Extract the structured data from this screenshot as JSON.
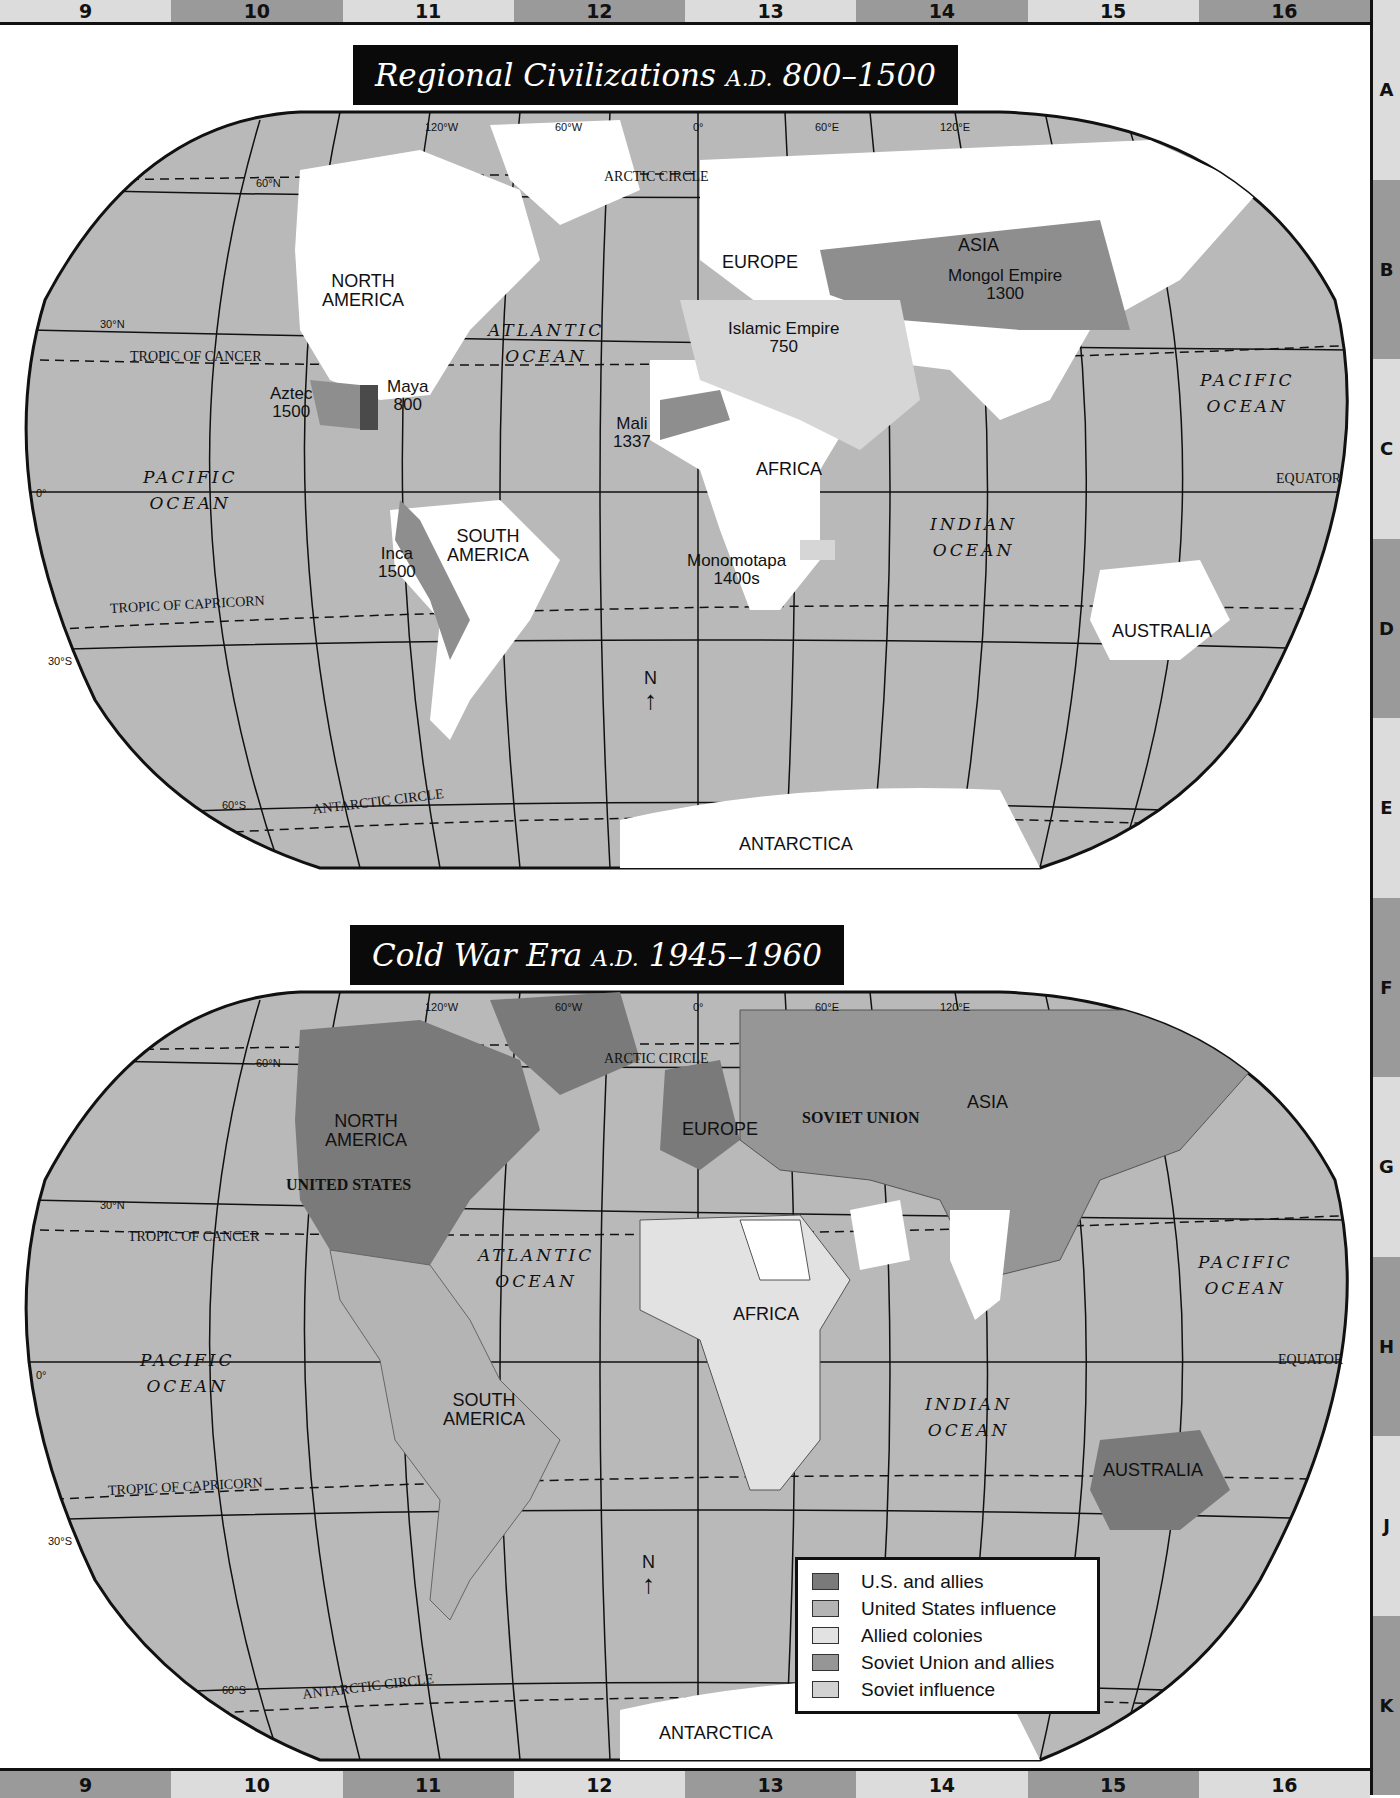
{
  "grid": {
    "columns": [
      "9",
      "10",
      "11",
      "12",
      "13",
      "14",
      "15",
      "16"
    ],
    "rows": [
      "A",
      "B",
      "C",
      "D",
      "E",
      "F",
      "G",
      "H",
      "J",
      "K"
    ]
  },
  "map1": {
    "title_main": "Regional Civilizations",
    "title_era": "A.D.",
    "title_years": "800–1500",
    "longitudes": [
      "120°W",
      "60°W",
      "0°",
      "60°E",
      "120°E"
    ],
    "latitudes": [
      "60°N",
      "30°N",
      "0°",
      "30°S",
      "60°S"
    ],
    "lines": {
      "arctic": "ARCTIC CIRCLE",
      "cancer": "TROPIC OF CANCER",
      "capricorn": "TROPIC OF CAPRICORN",
      "equator": "EQUATOR",
      "antarctic": "ANTARCTIC CIRCLE"
    },
    "continents": {
      "north_america_1": "NORTH",
      "north_america_2": "AMERICA",
      "south_america_1": "SOUTH",
      "south_america_2": "AMERICA",
      "europe": "EUROPE",
      "asia": "ASIA",
      "africa": "AFRICA",
      "australia": "AUSTRALIA",
      "antarctica": "ANTARCTICA"
    },
    "oceans": {
      "atlantic_1": "ATLANTIC",
      "atlantic_2": "OCEAN",
      "pacific_1": "PACIFIC",
      "pacific_2": "OCEAN",
      "indian_1": "INDIAN",
      "indian_2": "OCEAN"
    },
    "civilizations": [
      {
        "name": "Aztec",
        "year": "1500"
      },
      {
        "name": "Maya",
        "year": "800"
      },
      {
        "name": "Inca",
        "year": "1500"
      },
      {
        "name": "Mali",
        "year": "1337"
      },
      {
        "name": "Islamic Empire",
        "year": "750"
      },
      {
        "name": "Mongol Empire",
        "year": "1300"
      },
      {
        "name": "Monomotapa",
        "year": "1400s"
      }
    ],
    "compass": "N"
  },
  "map2": {
    "title_main": "Cold War Era",
    "title_era": "A.D.",
    "title_years": "1945–1960",
    "longitudes": [
      "120°W",
      "60°W",
      "0°",
      "60°E",
      "120°E"
    ],
    "latitudes": [
      "60°N",
      "30°N",
      "0°",
      "30°S",
      "60°S"
    ],
    "lines": {
      "arctic": "ARCTIC CIRCLE",
      "cancer": "TROPIC OF CANCER",
      "capricorn": "TROPIC OF CAPRICORN",
      "equator": "EQUATOR",
      "antarctic": "ANTARCTIC CIRCLE"
    },
    "continents": {
      "north_america_1": "NORTH",
      "north_america_2": "AMERICA",
      "united_states": "UNITED STATES",
      "south_america_1": "SOUTH",
      "south_america_2": "AMERICA",
      "europe": "EUROPE",
      "soviet_union": "SOVIET UNION",
      "asia": "ASIA",
      "africa": "AFRICA",
      "australia": "AUSTRALIA",
      "antarctica": "ANTARCTICA"
    },
    "oceans": {
      "atlantic_1": "ATLANTIC",
      "atlantic_2": "OCEAN",
      "pacific_1": "PACIFIC",
      "pacific_2": "OCEAN",
      "indian_1": "INDIAN",
      "indian_2": "OCEAN"
    },
    "compass": "N",
    "legend": [
      {
        "label": "U.S. and allies",
        "color": "#7a7a7a"
      },
      {
        "label": "United States influence",
        "color": "#b4b4b4"
      },
      {
        "label": "Allied colonies",
        "color": "#e2e2e2"
      },
      {
        "label": "Soviet Union and allies",
        "color": "#969696"
      },
      {
        "label": "Soviet influence",
        "color": "#d2d2d2"
      }
    ]
  },
  "colors": {
    "ocean": "#b9b9b9",
    "land_white": "#ffffff",
    "dark_region": "#8e8e8e",
    "darkest": "#4a4a4a",
    "light_region": "#d6d6d6",
    "us_allies": "#7a7a7a",
    "soviet": "#969696"
  }
}
